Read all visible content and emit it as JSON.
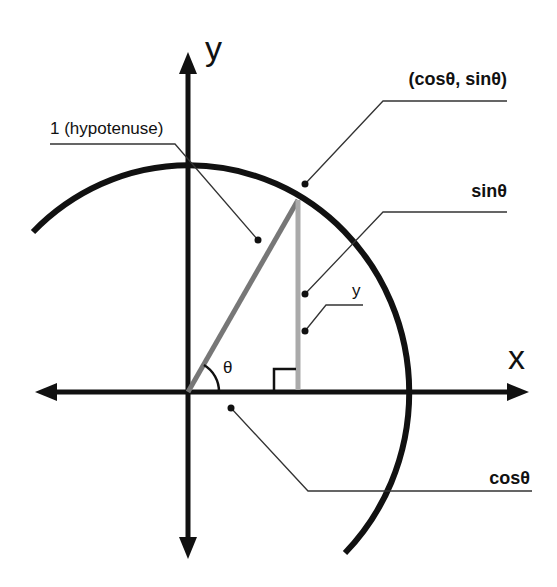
{
  "diagram": {
    "axes": {
      "x_label": "x",
      "y_label": "y"
    },
    "labels": {
      "hypotenuse": "1 (hypotenuse)",
      "point": "(cosθ, sinθ)",
      "sin": "sinθ",
      "opposite": "y",
      "cos": "cosθ",
      "angle": "θ"
    },
    "colors": {
      "axes": "#111111",
      "circle": "#111111",
      "hypotenuse": "#777777",
      "sine_segment": "#aaaaaa",
      "leader_lines": "#333333",
      "background": "#ffffff"
    }
  }
}
